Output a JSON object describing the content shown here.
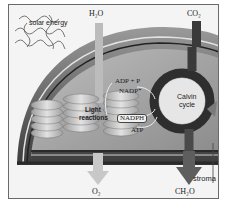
{
  "diagram": {
    "inputs": {
      "solar_energy": "solar energy",
      "water": "H₂O",
      "carbon_dioxide": "CO₂"
    },
    "outputs": {
      "oxygen": "O₂",
      "carbohydrate": "CH₂O"
    },
    "light_reactions": {
      "label_line1": "Light",
      "label_line2": "reactions"
    },
    "calvin_cycle": {
      "label_line1": "Calvin",
      "label_line2": "cycle"
    },
    "molecules": {
      "adp_p": "ADP + P",
      "nadp": "NADP⁺",
      "nadph": "NADPH",
      "atp": "ATP"
    },
    "regions": {
      "stroma": "stroma"
    },
    "colors": {
      "membrane_dark": "#3a3a3a",
      "membrane_mid": "#7a7a7a",
      "stroma_fill": "#a8a8a8",
      "thylakoid": "#d0d0d0",
      "calvin_ring": "#2e2e2e",
      "arrow_light": "#c8c8c8",
      "arrow_dark": "#5a5a5a"
    }
  }
}
